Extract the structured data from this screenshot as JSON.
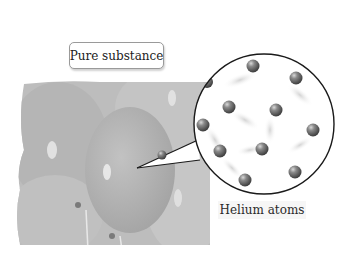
{
  "figure": {
    "top_label": "Pure substance",
    "magnified_label": "Helium atoms",
    "photo_subject": "Bunch of helium balloons",
    "colors": {
      "photo_gray": "#b4b4b4",
      "circle_border": "#1a1a1a",
      "atom": "#6e6e6e"
    },
    "magnifier": {
      "cx": 264,
      "cy": 124,
      "r": 70
    },
    "atoms": [
      {
        "x": 253,
        "y": 66
      },
      {
        "x": 296,
        "y": 78
      },
      {
        "x": 207,
        "y": 82
      },
      {
        "x": 229,
        "y": 107
      },
      {
        "x": 276,
        "y": 110
      },
      {
        "x": 203,
        "y": 125
      },
      {
        "x": 313,
        "y": 130
      },
      {
        "x": 220,
        "y": 151
      },
      {
        "x": 262,
        "y": 149
      },
      {
        "x": 245,
        "y": 180
      },
      {
        "x": 295,
        "y": 172
      },
      {
        "x": 162,
        "y": 155
      }
    ]
  }
}
